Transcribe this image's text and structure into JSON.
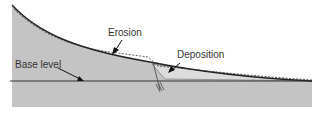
{
  "diagram": {
    "type": "geologic-profile",
    "labels": {
      "erosion": "Erosion",
      "deposition": "Deposition",
      "base_level": "Base level"
    },
    "colors": {
      "ground": "#c4c4c4",
      "deposit": "#dcdcdc",
      "line": "#222222",
      "text": "#333333"
    }
  }
}
